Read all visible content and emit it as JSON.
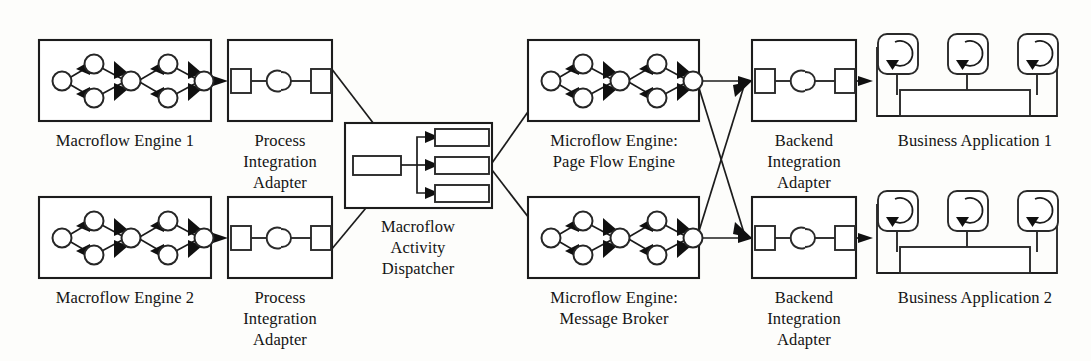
{
  "diagram": {
    "background_color": "#fdfdfb",
    "line_color": "#1c1c1c",
    "nodes": [
      {
        "id": "macroflow-engine-1",
        "label_lines": [
          "Macroflow Engine 1"
        ],
        "icon": "process-graph-icon",
        "column": 1,
        "row": "top"
      },
      {
        "id": "process-integration-adapter-1",
        "label_lines": [
          "Process",
          "Integration",
          "Adapter"
        ],
        "icon": "adapter-connector-icon",
        "column": 2,
        "row": "top"
      },
      {
        "id": "macroflow-activity-dispatcher",
        "label_lines": [
          "Macroflow",
          "Activity",
          "Dispatcher"
        ],
        "icon": "dispatcher-fanout-icon",
        "column": 3,
        "row": "middle"
      },
      {
        "id": "microflow-engine-page-flow",
        "label_lines": [
          "Microflow Engine:",
          "Page Flow Engine"
        ],
        "icon": "process-graph-icon",
        "column": 4,
        "row": "top"
      },
      {
        "id": "backend-integration-adapter-1",
        "label_lines": [
          "Backend",
          "Integration",
          "Adapter"
        ],
        "icon": "adapter-connector-icon",
        "column": 5,
        "row": "top"
      },
      {
        "id": "business-application-1",
        "label_lines": [
          "Business Application 1"
        ],
        "icon": "application-components-icon",
        "column": 6,
        "row": "top"
      },
      {
        "id": "macroflow-engine-2",
        "label_lines": [
          "Macroflow Engine 2"
        ],
        "icon": "process-graph-icon",
        "column": 1,
        "row": "bottom"
      },
      {
        "id": "process-integration-adapter-2",
        "label_lines": [
          "Process",
          "Integration",
          "Adapter"
        ],
        "icon": "adapter-connector-icon",
        "column": 2,
        "row": "bottom"
      },
      {
        "id": "microflow-engine-message-broker",
        "label_lines": [
          "Microflow Engine:",
          "Message Broker"
        ],
        "icon": "process-graph-icon",
        "column": 4,
        "row": "bottom"
      },
      {
        "id": "backend-integration-adapter-2",
        "label_lines": [
          "Backend",
          "Integration",
          "Adapter"
        ],
        "icon": "adapter-connector-icon",
        "column": 5,
        "row": "bottom"
      },
      {
        "id": "business-application-2",
        "label_lines": [
          "Business Application 2"
        ],
        "icon": "application-components-icon",
        "column": 6,
        "row": "bottom"
      }
    ],
    "labels": {
      "macroflow_engine_1": "Macroflow Engine 1",
      "macroflow_engine_2": "Macroflow Engine 2",
      "process_adapter_line1": "Process",
      "process_adapter_line2": "Integration",
      "process_adapter_line3": "Adapter",
      "dispatcher_line1": "Macroflow",
      "dispatcher_line2": "Activity",
      "dispatcher_line3": "Dispatcher",
      "microflow_page_line1": "Microflow Engine:",
      "microflow_page_line2": "Page Flow Engine",
      "microflow_broker_line1": "Microflow Engine:",
      "microflow_broker_line2": "Message Broker",
      "backend_adapter_line1": "Backend",
      "backend_adapter_line2": "Integration",
      "backend_adapter_line3": "Adapter",
      "business_application_1": "Business Application 1",
      "business_application_2": "Business Application 2"
    },
    "connections": [
      {
        "from": "macroflow-engine-1",
        "to": "process-integration-adapter-1",
        "style": "arrow"
      },
      {
        "from": "macroflow-engine-2",
        "to": "process-integration-adapter-2",
        "style": "arrow"
      },
      {
        "from": "process-integration-adapter-1",
        "to": "macroflow-activity-dispatcher",
        "style": "arrow"
      },
      {
        "from": "process-integration-adapter-2",
        "to": "macroflow-activity-dispatcher",
        "style": "arrow"
      },
      {
        "from": "macroflow-activity-dispatcher",
        "to": "microflow-engine-page-flow",
        "style": "arrow"
      },
      {
        "from": "macroflow-activity-dispatcher",
        "to": "microflow-engine-message-broker",
        "style": "arrow"
      },
      {
        "from": "microflow-engine-page-flow",
        "to": "backend-integration-adapter-1",
        "style": "arrow"
      },
      {
        "from": "microflow-engine-page-flow",
        "to": "backend-integration-adapter-2",
        "style": "arrow-cross"
      },
      {
        "from": "microflow-engine-message-broker",
        "to": "backend-integration-adapter-1",
        "style": "arrow-cross"
      },
      {
        "from": "microflow-engine-message-broker",
        "to": "backend-integration-adapter-2",
        "style": "arrow"
      },
      {
        "from": "backend-integration-adapter-1",
        "to": "business-application-1",
        "style": "arrow"
      },
      {
        "from": "backend-integration-adapter-2",
        "to": "business-application-2",
        "style": "arrow"
      }
    ]
  }
}
